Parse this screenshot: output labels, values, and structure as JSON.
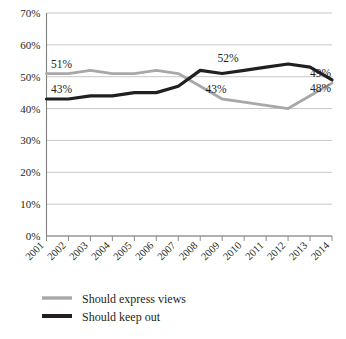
{
  "chart_data": {
    "type": "line",
    "title": "",
    "xlabel": "",
    "ylabel": "",
    "ylim": [
      0,
      70
    ],
    "ytick_labels": [
      "0%",
      "10%",
      "20%",
      "30%",
      "40%",
      "50%",
      "60%",
      "70%"
    ],
    "ytick_values": [
      0,
      10,
      20,
      30,
      40,
      50,
      60,
      70
    ],
    "grid": true,
    "legend_position": "bottom-left",
    "categories": [
      "2001",
      "2002",
      "2003",
      "2004",
      "2005",
      "2006",
      "2007",
      "2008",
      "2009",
      "2010",
      "2011",
      "2012",
      "2013",
      "2014"
    ],
    "series": [
      {
        "name": "Should express views",
        "color": "#a8a8a8",
        "values": [
          51,
          51,
          52,
          51,
          51,
          52,
          51,
          47,
          43,
          42,
          41,
          40,
          44,
          48
        ]
      },
      {
        "name": "Should keep out",
        "color": "#231f20",
        "values": [
          43,
          43,
          44,
          44,
          45,
          45,
          47,
          52,
          51,
          52,
          53,
          54,
          53,
          49
        ]
      }
    ],
    "annotations": [
      {
        "text": "51%",
        "series": "Should express views",
        "category": "2001",
        "value": 51,
        "position": "above-left"
      },
      {
        "text": "43%",
        "series": "Should keep out",
        "category": "2001",
        "value": 43,
        "position": "above-left"
      },
      {
        "text": "52%",
        "series": "Should keep out",
        "category": "2010",
        "value": 52,
        "position": "above"
      },
      {
        "text": "43%",
        "series": "Should express views",
        "category": "2009",
        "value": 43,
        "position": "above"
      },
      {
        "text": "49%",
        "series": "Should keep out",
        "category": "2014",
        "value": 49,
        "position": "right"
      },
      {
        "text": "48%",
        "series": "Should express views",
        "category": "2014",
        "value": 48,
        "position": "right"
      }
    ]
  },
  "axes": {
    "y_labels": [
      "70%",
      "60%",
      "50%",
      "40%",
      "30%",
      "20%",
      "10%",
      "0%"
    ],
    "x_labels": [
      "2001",
      "2002",
      "2003",
      "2004",
      "2005",
      "2006",
      "2007",
      "2008",
      "2009",
      "2010",
      "2011",
      "2012",
      "2013",
      "2014"
    ]
  },
  "annotations": {
    "label_a": "51%",
    "label_b": "43%",
    "label_c": "52%",
    "label_d": "43%",
    "label_e": "49%",
    "label_f": "48%"
  },
  "legend": {
    "items": [
      {
        "label": "Should express views",
        "color": "#a8a8a8"
      },
      {
        "label": "Should keep out",
        "color": "#231f20"
      }
    ]
  },
  "colors": {
    "series_gray": "#a8a8a8",
    "series_black": "#231f20",
    "gridline": "#b9b9b9",
    "axis": "#808080",
    "background": "#ffffff"
  }
}
